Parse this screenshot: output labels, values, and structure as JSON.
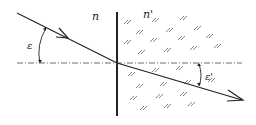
{
  "diagram": {
    "type": "refraction-at-interface",
    "labels": {
      "medium_left": "n",
      "medium_right": "n'",
      "angle_incidence": "ε",
      "angle_refraction": "ε'"
    },
    "colors": {
      "line": "#222222",
      "hatch": "#555555",
      "background": "#ffffff"
    }
  }
}
